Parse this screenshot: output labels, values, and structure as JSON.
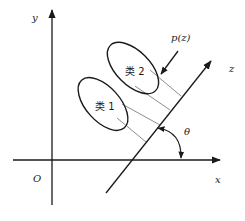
{
  "diagram": {
    "type": "projection-diagram",
    "axes": {
      "x_label": "x",
      "y_label": "y",
      "origin_label": "O"
    },
    "projection_axis": {
      "label": "z",
      "angle_label": "θ"
    },
    "distribution_label": "p(z)",
    "classes": [
      {
        "label": "类 1"
      },
      {
        "label": "类 2"
      }
    ],
    "colors": {
      "stroke": "#1a1a1a",
      "background": "#ffffff"
    }
  }
}
